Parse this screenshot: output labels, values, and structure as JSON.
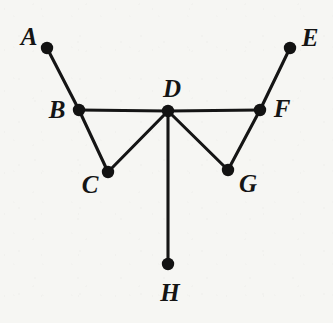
{
  "figure": {
    "kind": "graph-diagram",
    "background_color": "#f6f6f3",
    "ink_color": "#141414",
    "width": 333,
    "height": 323
  },
  "chart_data": {
    "type": "scatter",
    "title": "",
    "xlabel": "",
    "ylabel": "",
    "grid": false,
    "legend": "none",
    "xlim": [
      0,
      333
    ],
    "ylim": [
      0,
      323
    ],
    "nodes": [
      {
        "id": "A",
        "label": "A",
        "x": 47,
        "y": 48,
        "label_x": 29,
        "label_y": 36,
        "degree": 1
      },
      {
        "id": "B",
        "label": "B",
        "x": 79,
        "y": 110,
        "label_x": 57,
        "label_y": 109,
        "degree": 3
      },
      {
        "id": "C",
        "label": "C",
        "x": 108,
        "y": 172,
        "label_x": 90,
        "label_y": 184,
        "degree": 2
      },
      {
        "id": "D",
        "label": "D",
        "x": 168,
        "y": 111,
        "label_x": 172,
        "label_y": 88,
        "degree": 5
      },
      {
        "id": "E",
        "label": "E",
        "x": 290,
        "y": 48,
        "label_x": 310,
        "label_y": 37,
        "degree": 1
      },
      {
        "id": "F",
        "label": "F",
        "x": 260,
        "y": 110,
        "label_x": 282,
        "label_y": 108,
        "degree": 3
      },
      {
        "id": "G",
        "label": "G",
        "x": 228,
        "y": 170,
        "label_x": 248,
        "label_y": 183,
        "degree": 2
      },
      {
        "id": "H",
        "label": "H",
        "x": 168,
        "y": 264,
        "label_x": 170,
        "label_y": 292,
        "degree": 1
      }
    ],
    "node_radius": 6.2,
    "edges": [
      {
        "from": "A",
        "to": "B"
      },
      {
        "from": "B",
        "to": "C"
      },
      {
        "from": "B",
        "to": "D"
      },
      {
        "from": "C",
        "to": "D"
      },
      {
        "from": "D",
        "to": "F"
      },
      {
        "from": "D",
        "to": "G"
      },
      {
        "from": "D",
        "to": "H"
      },
      {
        "from": "G",
        "to": "F"
      },
      {
        "from": "F",
        "to": "E"
      }
    ],
    "edge_count": 9,
    "node_count": 8
  }
}
